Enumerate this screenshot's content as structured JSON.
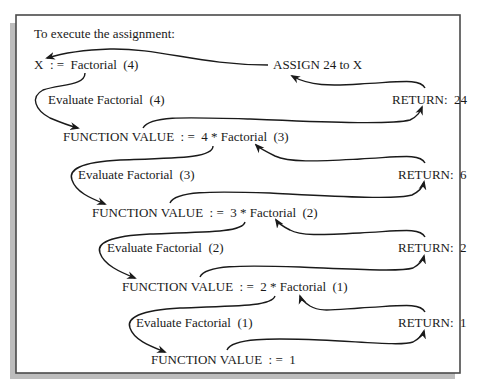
{
  "colors": {
    "frame": "#4a4a4a",
    "shadow": "#bdbdbd",
    "text": "#1a1a1a",
    "arrow": "#1a1a1a",
    "background": "#ffffff"
  },
  "diagram": {
    "title": "To execute the assignment:",
    "assignment": "X  : =  Factorial  (4)",
    "assign_result": "ASSIGN 24 to X",
    "levels": [
      {
        "evaluate": "Evaluate Factorial  (4)",
        "function_value": "FUNCTION VALUE  : =  4 * Factorial  (3)",
        "return": "RETURN:  24"
      },
      {
        "evaluate": "Evaluate Factorial  (3)",
        "function_value": "FUNCTION VALUE  : =  3 * Factorial  (2)",
        "return": "RETURN:  6"
      },
      {
        "evaluate": "Evaluate Factorial  (2)",
        "function_value": "FUNCTION VALUE  : =  2 * Factorial  (1)",
        "return": "RETURN:  2"
      },
      {
        "evaluate": "Evaluate Factorial  (1)",
        "function_value": "FUNCTION VALUE  : =  1",
        "return": "RETURN:  1"
      }
    ]
  }
}
